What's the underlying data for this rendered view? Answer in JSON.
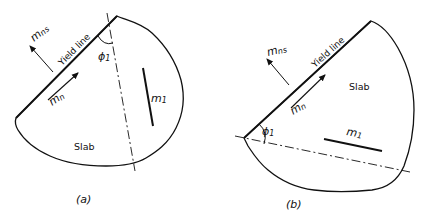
{
  "figure": {
    "panels": [
      {
        "id": "a",
        "caption": "(a)",
        "labels": {
          "mns": "m",
          "mns_sub": "ns",
          "yield_line": "Yield line",
          "mn": "m",
          "mn_sub": "n",
          "phi": "ϕ",
          "phi_sub": "1",
          "m1": "m",
          "m1_sub": "1",
          "slab": "Slab"
        }
      },
      {
        "id": "b",
        "caption": "(b)",
        "labels": {
          "mns": "m",
          "mns_sub": "ns",
          "yield_line": "Yield line",
          "mn": "m",
          "mn_sub": "n",
          "phi": "ϕ",
          "phi_sub": "1",
          "m1": "m",
          "m1_sub": "1",
          "slab": "Slab"
        }
      }
    ]
  }
}
